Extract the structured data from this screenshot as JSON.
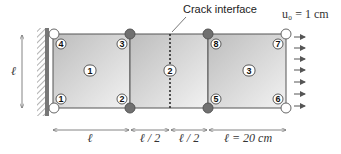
{
  "diagram": {
    "crack_label": "Crack interface",
    "displacement_label": "u₀ = 1 cm",
    "height_label": "ℓ",
    "dimensions": [
      "ℓ",
      "ℓ / 2",
      "ℓ / 2",
      "ℓ = 20 cm"
    ],
    "elements": [
      "1",
      "2",
      "3"
    ],
    "nodes": [
      {
        "id": "1",
        "type": "fixed"
      },
      {
        "id": "2",
        "type": "interface"
      },
      {
        "id": "3",
        "type": "interface"
      },
      {
        "id": "4",
        "type": "fixed"
      },
      {
        "id": "5",
        "type": "interface"
      },
      {
        "id": "6",
        "type": "loaded"
      },
      {
        "id": "7",
        "type": "loaded"
      },
      {
        "id": "8",
        "type": "interface"
      }
    ],
    "colors": {
      "interface_node": "#707070",
      "free_node": "#ffffff",
      "element_fill_dark": "#c8c8c8",
      "element_fill_light": "#f0f0f0"
    }
  }
}
